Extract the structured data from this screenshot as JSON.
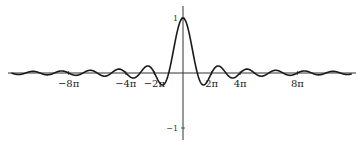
{
  "chart_data": {
    "type": "line",
    "title": "",
    "function": "sin(x)/x",
    "xlabel": "",
    "ylabel": "",
    "x_ticks": [
      {
        "value": -8,
        "label": "−8π"
      },
      {
        "value": -4,
        "label": "−4π"
      },
      {
        "value": -2,
        "label": "−2π"
      },
      {
        "value": 2,
        "label": "2π"
      },
      {
        "value": 4,
        "label": "4π"
      },
      {
        "value": 8,
        "label": "8π"
      }
    ],
    "y_ticks": [
      {
        "value": 1,
        "label": "1"
      },
      {
        "value": -1,
        "label": "−1"
      }
    ],
    "xlim_pi": [
      -12,
      12
    ],
    "ylim": [
      -1.1,
      1.1
    ],
    "grid": false,
    "legend": null,
    "series": [
      {
        "name": "sinc",
        "x_units": "pi",
        "samples": "computed from sin(x)/x over x in [-12π, 12π]"
      }
    ],
    "key_points": [
      {
        "x": 0,
        "y": 1
      },
      {
        "x_pi": 1,
        "y": 0
      },
      {
        "x_pi": 1.43,
        "y": -0.217
      },
      {
        "x_pi": 2.46,
        "y": 0.128
      },
      {
        "x_pi": 3.47,
        "y": -0.091
      }
    ]
  },
  "colors": {
    "curve": "#1a1a1a",
    "axis": "#333333",
    "background": "#ffffff"
  },
  "layout": {
    "origin_x": 183,
    "origin_y": 73,
    "px_per_pi": 14.3,
    "px_per_unit_y": 55,
    "axis_left": 8,
    "axis_right": 356,
    "axis_top": 6,
    "axis_bottom": 140
  }
}
